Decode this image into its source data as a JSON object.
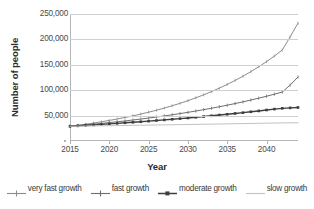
{
  "chart_data": {
    "type": "line",
    "title": "",
    "xlabel": "Year",
    "ylabel": "Number of people",
    "xlim": [
      2015,
      2044
    ],
    "ylim": [
      0,
      250000
    ],
    "grid": "horizontal",
    "legend_position": "bottom",
    "x": [
      2015,
      2016,
      2017,
      2018,
      2019,
      2020,
      2021,
      2022,
      2023,
      2024,
      2025,
      2026,
      2027,
      2028,
      2029,
      2030,
      2031,
      2032,
      2033,
      2034,
      2035,
      2036,
      2037,
      2038,
      2039,
      2040,
      2041,
      2042,
      2043,
      2044
    ],
    "xticks": [
      "2015",
      "2020",
      "2025",
      "2030",
      "2035",
      "2040"
    ],
    "xtick_values": [
      2015,
      2020,
      2025,
      2030,
      2035,
      2040
    ],
    "yticks": [
      "50,000",
      "100,000",
      "150,000",
      "200,000",
      "250,000"
    ],
    "ytick_values": [
      50000,
      100000,
      150000,
      200000,
      250000
    ],
    "series": [
      {
        "name": "very fast growth",
        "color": "#8c8c8c",
        "marker": "line-dot",
        "values": [
          29000,
          31000,
          33100,
          35400,
          37900,
          40500,
          43300,
          46300,
          49500,
          53000,
          56700,
          60600,
          64800,
          69400,
          74200,
          79400,
          85000,
          90900,
          97300,
          104100,
          111400,
          119200,
          127600,
          136500,
          146100,
          156300,
          167300,
          179000,
          205000,
          232000
        ]
      },
      {
        "name": "fast growth",
        "color": "#6e6e6e",
        "marker": "line-tick",
        "values": [
          29000,
          30300,
          31700,
          33100,
          34600,
          36200,
          37800,
          39500,
          41300,
          43200,
          45200,
          47200,
          49400,
          51600,
          54000,
          56400,
          59000,
          61700,
          64500,
          67400,
          70500,
          73700,
          77000,
          80600,
          84300,
          88100,
          92200,
          96400,
          110000,
          126000
        ]
      },
      {
        "name": "moderate growth",
        "color": "#3f3f3f",
        "marker": "square",
        "values": [
          29000,
          29900,
          30800,
          31700,
          32700,
          33700,
          34700,
          35800,
          36800,
          37900,
          39100,
          40300,
          41500,
          42700,
          44000,
          45300,
          46700,
          48100,
          49600,
          51100,
          52600,
          54200,
          55800,
          57500,
          59200,
          61000,
          62800,
          64300,
          65200,
          66000
        ]
      },
      {
        "name": "slow growth",
        "color": "#c2c2c2",
        "marker": "plain",
        "values": [
          29000,
          29200,
          29400,
          29600,
          29900,
          30100,
          30300,
          30500,
          30800,
          31000,
          31200,
          31500,
          31700,
          32000,
          32200,
          32500,
          32700,
          33000,
          33200,
          33500,
          33700,
          34000,
          34300,
          34500,
          34800,
          35100,
          35300,
          35600,
          35800,
          36000
        ]
      }
    ]
  },
  "axes": {
    "y_title": "Number of people",
    "x_title": "Year",
    "zero_tick_visible": true
  },
  "legend": {
    "items": [
      {
        "label": "very fast growth"
      },
      {
        "label": "fast growth"
      },
      {
        "label": "moderate growth"
      },
      {
        "label": "slow growth"
      }
    ]
  }
}
